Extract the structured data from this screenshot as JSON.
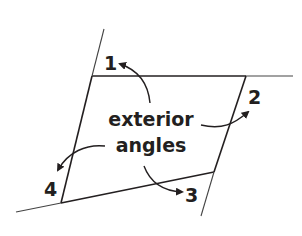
{
  "diagram": {
    "caption_line1": "exterior",
    "caption_line2": "angles",
    "angle_labels": [
      "1",
      "2",
      "3",
      "4"
    ],
    "colors": {
      "line": "#231f20",
      "extension": "#555555",
      "background": "#ffffff"
    }
  }
}
